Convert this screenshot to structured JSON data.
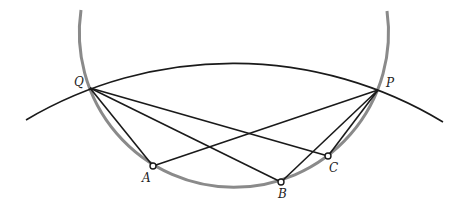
{
  "diagram": {
    "type": "geometry",
    "colors": {
      "line": "#1a1a1a",
      "circle": "#8a8a8a",
      "background": "#ffffff"
    },
    "points": {
      "Q": {
        "label": "Q",
        "x": 90,
        "y": 88
      },
      "P": {
        "label": "P",
        "x": 378,
        "y": 90
      },
      "A": {
        "label": "A",
        "x": 153,
        "y": 166
      },
      "B": {
        "label": "B",
        "x": 281,
        "y": 182
      },
      "C": {
        "label": "C",
        "x": 328,
        "y": 156
      }
    },
    "segments": [
      "QA",
      "QB",
      "QC",
      "PA",
      "PB",
      "PC"
    ],
    "curves": [
      {
        "name": "circle-arc",
        "color": "gray",
        "through": [
          "Q",
          "A",
          "B",
          "C",
          "P"
        ]
      },
      {
        "name": "outer-arc",
        "color": "black",
        "through": [
          "Q",
          "P"
        ]
      }
    ],
    "labels": {
      "Q": "Q",
      "P": "P",
      "A": "A",
      "B": "B",
      "C": "C"
    }
  }
}
